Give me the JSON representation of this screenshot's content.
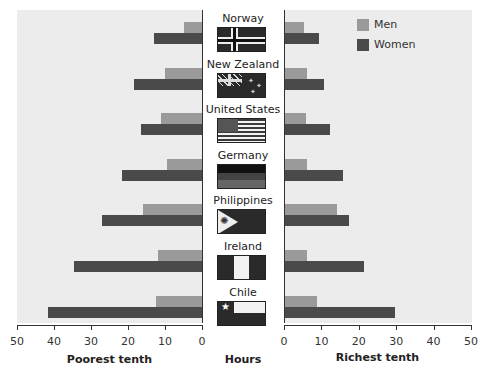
{
  "chart_data": {
    "type": "bar",
    "orientation": "horizontal-butterfly",
    "categories": [
      "Norway",
      "New Zealand",
      "United States",
      "Germany",
      "Philippines",
      "Ireland",
      "Chile"
    ],
    "panels": [
      {
        "name": "Poorest tenth",
        "direction": "left",
        "xlim": [
          50,
          0
        ],
        "ticks": [
          "50",
          "40",
          "30",
          "20",
          "10",
          "0"
        ],
        "series": [
          {
            "name": "Men",
            "color": "#9a9a9a",
            "values": [
              5,
              10,
              11,
              9.5,
              16,
              12,
              12.5
            ]
          },
          {
            "name": "Women",
            "color": "#4a4a4a",
            "values": [
              13,
              18.5,
              16.5,
              21.5,
              27,
              34.5,
              41.5
            ]
          }
        ]
      },
      {
        "name": "Richest tenth",
        "direction": "right",
        "xlim": [
          0,
          50
        ],
        "ticks": [
          "0",
          "10",
          "20",
          "30",
          "40",
          "50"
        ],
        "series": [
          {
            "name": "Men",
            "color": "#9a9a9a",
            "values": [
              5,
              6,
              5.5,
              6,
              14,
              6,
              8.5
            ]
          },
          {
            "name": "Women",
            "color": "#4a4a4a",
            "values": [
              9,
              10.5,
              12,
              15.5,
              17,
              21,
              29.5
            ]
          }
        ]
      }
    ],
    "xlabel_center": "Hours",
    "xlabel_left": "Poorest tenth",
    "xlabel_right": "Richest tenth",
    "legend": {
      "position": "top-right",
      "entries": [
        "Men",
        "Women"
      ]
    },
    "grid": false
  },
  "labels": {
    "left_axis_title": "Poorest tenth",
    "center_axis_title": "Hours",
    "right_axis_title": "Richest tenth",
    "legend_men": "Men",
    "legend_women": "Women"
  },
  "colors": {
    "men": "#9a9a9a",
    "women": "#4a4a4a",
    "panel_bg": "#ececec"
  }
}
